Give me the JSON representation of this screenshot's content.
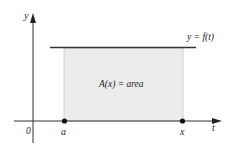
{
  "diagram": {
    "axes": {
      "y_label": "y",
      "x_label": "t",
      "origin_label": "0"
    },
    "curve": {
      "label": "y = f(t)",
      "line_color": "#333333"
    },
    "region": {
      "label": "A(x) = area",
      "fill_color": "#ececec",
      "edge_color": "#c8c8c8"
    },
    "points": [
      {
        "label": "a"
      },
      {
        "label": "x"
      }
    ]
  }
}
